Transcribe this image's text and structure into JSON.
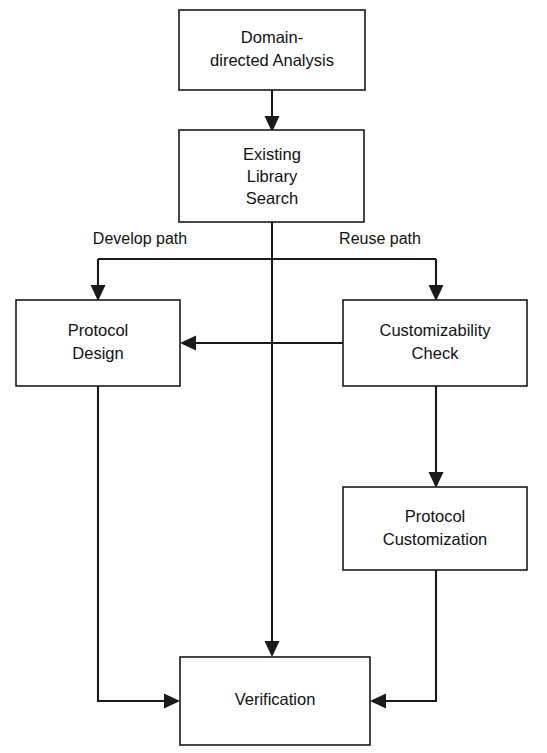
{
  "diagram": {
    "type": "flowchart",
    "background_color": "#ffffff",
    "line_color": "#1a1a1a",
    "text_color": "#111111",
    "nodes": [
      {
        "id": "domain-directed-analysis",
        "label_line1": "Domain-",
        "label_line2": "directed Analysis",
        "x": 179,
        "y": 10,
        "w": 186,
        "h": 80
      },
      {
        "id": "existing-library-search",
        "label_line1": "Existing",
        "label_line2": "Library",
        "label_line3": "Search",
        "x": 179,
        "y": 130,
        "w": 185,
        "h": 92
      },
      {
        "id": "protocol-design",
        "label_line1": "Protocol",
        "label_line2": "Design",
        "x": 16,
        "y": 300,
        "w": 164,
        "h": 86
      },
      {
        "id": "customizability-check",
        "label_line1": "Customizability",
        "label_line2": "Check",
        "x": 343,
        "y": 300,
        "w": 184,
        "h": 86
      },
      {
        "id": "protocol-customization",
        "label_line1": "Protocol",
        "label_line2": "Customization",
        "x": 343,
        "y": 487,
        "w": 184,
        "h": 83
      },
      {
        "id": "verification",
        "label_line1": "Verification",
        "x": 180,
        "y": 657,
        "w": 190,
        "h": 88
      }
    ],
    "edge_labels": {
      "develop_path": "Develop path",
      "reuse_path": "Reuse path"
    },
    "edges": [
      {
        "id": "analysis-to-search",
        "from": "domain-directed-analysis",
        "to": "existing-library-search"
      },
      {
        "id": "search-to-branch-develop",
        "from": "existing-library-search",
        "to": "protocol-design",
        "label": "Develop path"
      },
      {
        "id": "search-to-branch-reuse",
        "from": "existing-library-search",
        "to": "customizability-check",
        "label": "Reuse path"
      },
      {
        "id": "search-to-verification",
        "from": "existing-library-search",
        "to": "verification"
      },
      {
        "id": "check-to-design",
        "from": "customizability-check",
        "to": "protocol-design"
      },
      {
        "id": "check-to-customization",
        "from": "customizability-check",
        "to": "protocol-customization"
      },
      {
        "id": "design-to-verification",
        "from": "protocol-design",
        "to": "verification"
      },
      {
        "id": "customization-to-verification",
        "from": "protocol-customization",
        "to": "verification"
      }
    ]
  }
}
